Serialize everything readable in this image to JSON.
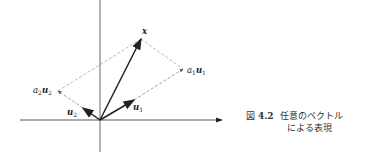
{
  "figure": {
    "type": "vector-decomposition",
    "labels": {
      "x": "x",
      "u1": "u",
      "u1_sub": "1",
      "u2": "u",
      "u2_sub": "2",
      "a1u1_coef": "a",
      "a1u1_coef_sub": "1",
      "a1u1_vec": "u",
      "a1u1_vec_sub": "1",
      "a2u2_coef": "a",
      "a2u2_coef_sub": "2",
      "a2u2_vec": "u",
      "a2u2_vec_sub": "2"
    },
    "colors": {
      "vector": "#222222",
      "axis": "#444444",
      "dashed": "#888888"
    }
  },
  "caption": {
    "prefix": "図",
    "number": "4.2",
    "line1": "任意のベクトル",
    "line2": "による表現"
  }
}
